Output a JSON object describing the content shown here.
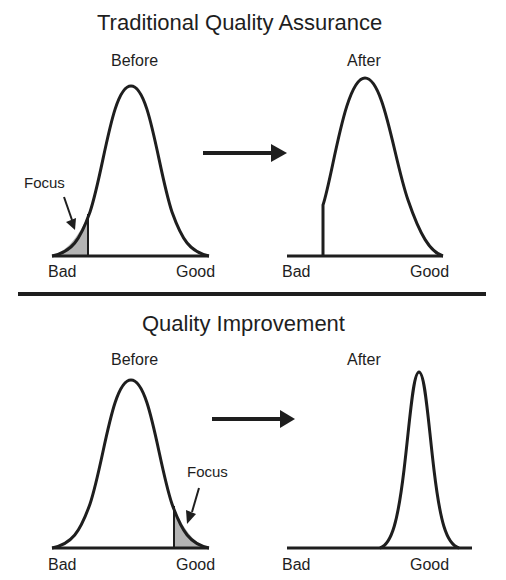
{
  "top_section": {
    "title": "Traditional Quality Assurance",
    "before": {
      "label": "Before",
      "axis_left": "Bad",
      "axis_right": "Good",
      "annotation": "Focus",
      "shaded_region": "left tail (bad end)"
    },
    "after": {
      "label": "After",
      "axis_left": "Bad",
      "axis_right": "Good",
      "shape": "distribution with left tail truncated"
    }
  },
  "bottom_section": {
    "title": "Quality Improvement",
    "before": {
      "label": "Before",
      "axis_left": "Bad",
      "axis_right": "Good",
      "annotation": "Focus",
      "shaded_region": "right tail (good end)"
    },
    "after": {
      "label": "After",
      "axis_left": "Bad",
      "axis_right": "Good",
      "shape": "narrow distribution shifted toward good"
    }
  },
  "colors": {
    "line": "#1e1e1e",
    "shade": "#b4b4b4",
    "background": "#ffffff"
  },
  "icons": {
    "transition_arrow": "right-arrow-icon",
    "focus_pointer": "pointer-arrow-icon"
  }
}
